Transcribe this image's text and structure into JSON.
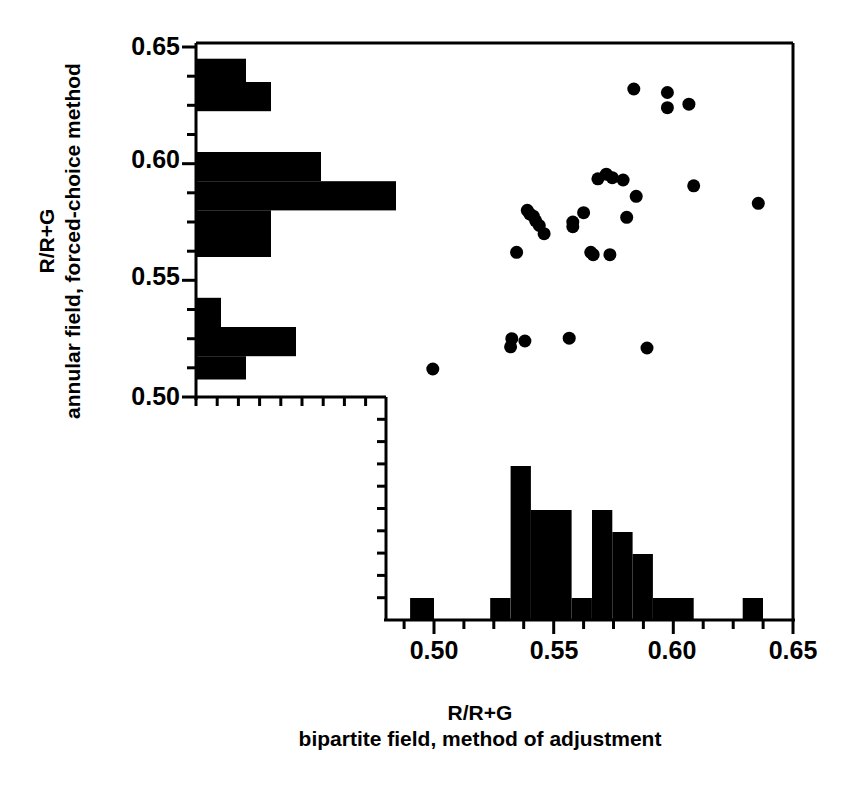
{
  "figure": {
    "background": "#ffffff",
    "ink_color": "#000000",
    "axis_line_width": 3
  },
  "y_axis": {
    "title_line1": "R/R+G",
    "title_line2": "annular field, forced-choice method",
    "tick_labels": [
      "0.65",
      "0.60",
      "0.55",
      "0.50"
    ],
    "tick_values": [
      0.65,
      0.6,
      0.55,
      0.5
    ],
    "minor_tick_step": 0.0125,
    "range": [
      0.5,
      0.65
    ]
  },
  "x_axis": {
    "title_line1": "R/R+G",
    "title_line2": "bipartite field, method of adjustment",
    "tick_labels": [
      "0.50",
      "0.55",
      "0.60",
      "0.65"
    ],
    "tick_values": [
      0.5,
      0.55,
      0.6,
      0.65
    ],
    "minor_tick_step": 0.0125,
    "range": [
      0.48,
      0.65
    ]
  },
  "chart_data": {
    "type": "scatter",
    "title": "",
    "xlabel": "R/R+G bipartite field, method of adjustment",
    "ylabel": "R/R+G annular field, forced-choice method",
    "xlim": [
      0.48,
      0.65
    ],
    "ylim": [
      0.5,
      0.65
    ],
    "grid": false,
    "legend": "none",
    "marker": "filled-circle",
    "marker_color": "#000000",
    "marker_size_px": 13,
    "points": [
      {
        "x": 0.4995,
        "y": 0.512
      },
      {
        "x": 0.5325,
        "y": 0.525
      },
      {
        "x": 0.532,
        "y": 0.5215
      },
      {
        "x": 0.538,
        "y": 0.524
      },
      {
        "x": 0.5565,
        "y": 0.5252
      },
      {
        "x": 0.5655,
        "y": 0.562
      },
      {
        "x": 0.5665,
        "y": 0.561
      },
      {
        "x": 0.5735,
        "y": 0.561
      },
      {
        "x": 0.589,
        "y": 0.521
      },
      {
        "x": 0.5345,
        "y": 0.562
      },
      {
        "x": 0.539,
        "y": 0.58
      },
      {
        "x": 0.54,
        "y": 0.5785
      },
      {
        "x": 0.5415,
        "y": 0.5775
      },
      {
        "x": 0.5425,
        "y": 0.5755
      },
      {
        "x": 0.544,
        "y": 0.5735
      },
      {
        "x": 0.546,
        "y": 0.57
      },
      {
        "x": 0.558,
        "y": 0.575
      },
      {
        "x": 0.558,
        "y": 0.573
      },
      {
        "x": 0.5625,
        "y": 0.579
      },
      {
        "x": 0.5685,
        "y": 0.5935
      },
      {
        "x": 0.572,
        "y": 0.5955
      },
      {
        "x": 0.5745,
        "y": 0.594
      },
      {
        "x": 0.579,
        "y": 0.593
      },
      {
        "x": 0.5805,
        "y": 0.577
      },
      {
        "x": 0.5845,
        "y": 0.586
      },
      {
        "x": 0.6085,
        "y": 0.5905
      },
      {
        "x": 0.6355,
        "y": 0.583
      },
      {
        "x": 0.5835,
        "y": 0.632
      },
      {
        "x": 0.5975,
        "y": 0.6305
      },
      {
        "x": 0.5975,
        "y": 0.624
      },
      {
        "x": 0.6065,
        "y": 0.6255
      }
    ],
    "y_histogram": {
      "orientation": "horizontal",
      "bin_width": 0.0125,
      "bins": [
        {
          "y_low": 0.635,
          "y_high": 0.645,
          "count": 2
        },
        {
          "y_low": 0.6225,
          "y_high": 0.635,
          "count": 3
        },
        {
          "y_low": 0.5925,
          "y_high": 0.605,
          "count": 5
        },
        {
          "y_low": 0.58,
          "y_high": 0.5925,
          "count": 8
        },
        {
          "y_low": 0.56,
          "y_high": 0.58,
          "count": 3
        },
        {
          "y_low": 0.53,
          "y_high": 0.5425,
          "count": 1
        },
        {
          "y_low": 0.5175,
          "y_high": 0.53,
          "count": 4
        },
        {
          "y_low": 0.5075,
          "y_high": 0.5175,
          "count": 2
        }
      ]
    },
    "x_histogram": {
      "orientation": "vertical",
      "bin_width": 0.0085,
      "bins": [
        {
          "x_low": 0.49,
          "x_high": 0.5,
          "count": 1
        },
        {
          "x_low": 0.5235,
          "x_high": 0.532,
          "count": 1
        },
        {
          "x_low": 0.532,
          "x_high": 0.5405,
          "count": 7
        },
        {
          "x_low": 0.5405,
          "x_high": 0.5575,
          "count": 5
        },
        {
          "x_low": 0.5575,
          "x_high": 0.566,
          "count": 1
        },
        {
          "x_low": 0.566,
          "x_high": 0.5745,
          "count": 5
        },
        {
          "x_low": 0.5745,
          "x_high": 0.583,
          "count": 4
        },
        {
          "x_low": 0.583,
          "x_high": 0.5915,
          "count": 3
        },
        {
          "x_low": 0.5915,
          "x_high": 0.6085,
          "count": 1
        },
        {
          "x_low": 0.629,
          "x_high": 0.6375,
          "count": 1
        }
      ]
    }
  }
}
